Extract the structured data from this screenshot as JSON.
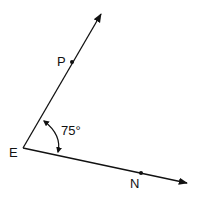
{
  "diagram": {
    "type": "angle",
    "vertex": {
      "label": "E"
    },
    "rays": [
      {
        "name": "ray-EP",
        "point_label": "P"
      },
      {
        "name": "ray-EN",
        "point_label": "N"
      }
    ],
    "angle": {
      "label": "75°",
      "value_degrees": 75,
      "between": [
        "P",
        "E",
        "N"
      ]
    },
    "colors": {
      "stroke": "#111111",
      "background": "#ffffff"
    }
  }
}
